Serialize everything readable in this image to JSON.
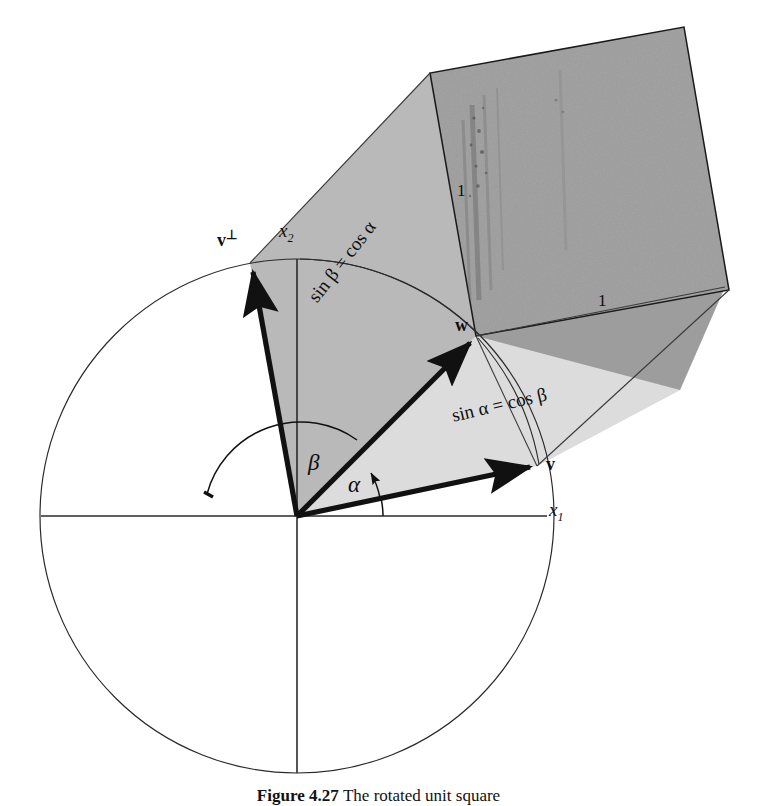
{
  "figure": {
    "kind": "geometry-diagram",
    "caption_number": "Figure 4.27",
    "caption_text": "The rotated unit square",
    "background_color": "#ffffff",
    "ink_color": "#111111",
    "fill_dark_square": "#9a9a9a",
    "fill_mid_sector": "#b5b5b5",
    "fill_light_sector": "#d8d8d8"
  },
  "axes": {
    "x_axis_label": "x",
    "x_axis_subscript": "1",
    "y_axis_label": "x",
    "y_axis_subscript": "2"
  },
  "vectors": [
    {
      "name": "v-perp",
      "label": "v",
      "superscript": "⊥",
      "angle_deg": 103,
      "length": 257
    },
    {
      "name": "v",
      "label": "v",
      "superscript": "",
      "angle_deg": 12,
      "length": 257
    },
    {
      "name": "w",
      "label": "w",
      "superscript": "",
      "angle_deg": 45,
      "length": 257
    }
  ],
  "angles": [
    {
      "name": "alpha",
      "symbol": "α",
      "from_deg": 0,
      "to_deg": 12
    },
    {
      "name": "beta",
      "symbol": "β",
      "from_deg": 12,
      "to_deg": 103
    }
  ],
  "arc_labels": [
    {
      "name": "sin-beta-equals-cos-alpha",
      "text": "sin β = cos α",
      "rotation_deg": -52
    },
    {
      "name": "sin-alpha-equals-cos-beta",
      "text": "sin α = cos β",
      "rotation_deg": -13
    }
  ],
  "square": {
    "name": "unit-square",
    "vertex_label": "w",
    "side_label_left": "1",
    "side_label_bottom": "1"
  },
  "circle": {
    "name": "unit-circle",
    "center_x": 297,
    "center_y": 516,
    "radius": 257
  }
}
